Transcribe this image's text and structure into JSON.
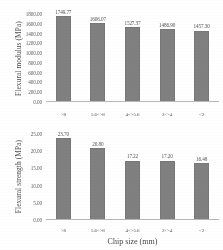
{
  "figure": {
    "xlabel": "Chip size (mm)",
    "categories": [
      ">8",
      "5.6<>8",
      "4<>5.6",
      "2<>4",
      "<2"
    ]
  },
  "chart_data": [
    {
      "type": "bar",
      "title": "",
      "xlabel": "Chip size (mm)",
      "ylabel": "Flexural modulus (MPa)",
      "categories": [
        ">8",
        "5.6<>8",
        "4<>5.6",
        "2<>4",
        "<2"
      ],
      "values": [
        1749.77,
        1606.07,
        1527.37,
        1486.9,
        1457.3
      ],
      "value_labels": [
        "1749.77",
        "1606.07",
        "1527.37",
        "1486.90",
        "1457.30"
      ],
      "ylim": [
        0,
        1800
      ],
      "yticks": [
        0,
        200,
        400,
        600,
        800,
        1000,
        1200,
        1400,
        1600,
        1800
      ],
      "ytick_labels": [
        "0.00",
        "200.00",
        "400.00",
        "600.00",
        "800.00",
        "1000.00",
        "1200.00",
        "1400.00",
        "1600.00",
        "1800.00"
      ],
      "grid": false,
      "legend": false,
      "bar_color": "#7d7d7d"
    },
    {
      "type": "bar",
      "title": "",
      "xlabel": "Chip size (mm)",
      "ylabel": "Flexural strength (MPa)",
      "categories": [
        ">8",
        "5.6<>8",
        "4<>5.6",
        "2<>4",
        "<2"
      ],
      "values": [
        23.7,
        20.8,
        17.22,
        17.2,
        16.48
      ],
      "value_labels": [
        "23.70",
        "20.80",
        "17.22",
        "17.20",
        "16.48"
      ],
      "ylim": [
        0,
        25
      ],
      "yticks": [
        0,
        5,
        10,
        15,
        20,
        25
      ],
      "ytick_labels": [
        "0.00",
        "5.00",
        "10.00",
        "15.00",
        "20.00",
        "25.00"
      ],
      "grid": false,
      "legend": false,
      "bar_color": "#7d7d7d"
    }
  ]
}
